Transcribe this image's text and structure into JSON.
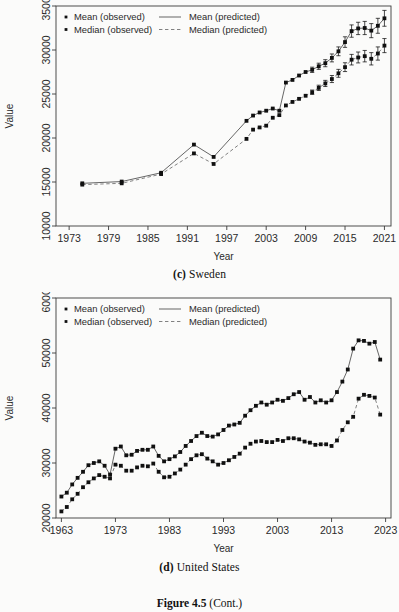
{
  "figure": {
    "caption_number": "Figure 4.5",
    "caption_rest": "(Cont.)"
  },
  "panels": [
    {
      "id": "c",
      "panel_letter": "(c)",
      "panel_title": "Sweden",
      "axis": {
        "xlabel": "Year",
        "ylabel": "Value"
      },
      "legend": {
        "mean_observed": "Mean (observed)",
        "median_observed": "Median (observed)",
        "mean_predicted": "Mean (predicted)",
        "median_predicted": "Median (predicted)"
      }
    },
    {
      "id": "d",
      "panel_letter": "(d)",
      "panel_title": "United States",
      "axis": {
        "xlabel": "Year",
        "ylabel": "Value"
      },
      "legend": {
        "mean_observed": "Mean (observed)",
        "median_observed": "Median (observed)",
        "mean_predicted": "Mean (predicted)",
        "median_predicted": "Median (predicted)"
      }
    }
  ],
  "chart_data": [
    {
      "type": "line",
      "id": "sweden",
      "title": "(c) Sweden",
      "xlabel": "Year",
      "ylabel": "Value",
      "xlim": [
        1971,
        2022
      ],
      "ylim": [
        10000,
        35000
      ],
      "xticks": [
        1973,
        1979,
        1985,
        1991,
        1997,
        2003,
        2009,
        2015,
        2021
      ],
      "yticks": [
        10000,
        15000,
        20000,
        25000,
        30000,
        35000
      ],
      "grid": false,
      "legend_position": "top-left",
      "series": [
        {
          "name": "Mean (observed)",
          "style": "points-solid-line",
          "x": [
            1975,
            1981,
            1987,
            1992,
            1995,
            2000,
            2001,
            2002,
            2003,
            2004,
            2005,
            2006,
            2007,
            2008,
            2009,
            2010,
            2011,
            2012,
            2013,
            2014,
            2015,
            2016,
            2017,
            2018,
            2019,
            2020,
            2021
          ],
          "values": [
            14850,
            15050,
            16050,
            19250,
            17850,
            21950,
            22550,
            22900,
            23100,
            23350,
            23100,
            26300,
            26600,
            27100,
            27500,
            27750,
            28150,
            28500,
            29100,
            29850,
            30900,
            32150,
            32450,
            32500,
            32200,
            32750,
            33600
          ],
          "errors": [
            0,
            0,
            0,
            0,
            0,
            0,
            0,
            0,
            0,
            0,
            0,
            0,
            0,
            0,
            0,
            300,
            350,
            400,
            450,
            500,
            600,
            700,
            700,
            750,
            800,
            850,
            900
          ]
        },
        {
          "name": "Median (observed)",
          "style": "points-dashed-line",
          "x": [
            1975,
            1981,
            1987,
            1992,
            1995,
            2000,
            2001,
            2002,
            2003,
            2004,
            2005,
            2006,
            2007,
            2008,
            2009,
            2010,
            2011,
            2012,
            2013,
            2014,
            2015,
            2016,
            2017,
            2018,
            2019,
            2020,
            2021
          ],
          "values": [
            14700,
            14850,
            15900,
            18250,
            17050,
            19900,
            20950,
            21200,
            21400,
            22300,
            22600,
            23700,
            24100,
            24450,
            24800,
            25200,
            25700,
            26200,
            26700,
            27350,
            28050,
            28900,
            29150,
            29300,
            29000,
            29600,
            30500
          ],
          "errors": [
            0,
            0,
            0,
            0,
            0,
            0,
            0,
            0,
            0,
            0,
            0,
            0,
            0,
            0,
            0,
            250,
            300,
            350,
            400,
            450,
            500,
            600,
            620,
            650,
            700,
            750,
            800
          ]
        }
      ]
    },
    {
      "type": "line",
      "id": "united-states",
      "title": "(d) United States",
      "xlabel": "Year",
      "ylabel": "Value",
      "xlim": [
        1962,
        2024
      ],
      "ylim": [
        20000,
        60000
      ],
      "xticks": [
        1963,
        1973,
        1983,
        1993,
        2003,
        2013,
        2023
      ],
      "yticks": [
        20000,
        30000,
        40000,
        50000,
        60000
      ],
      "grid": false,
      "legend_position": "top-left",
      "series": [
        {
          "name": "Mean (observed)",
          "style": "points-solid-line",
          "x": [
            1963,
            1964,
            1965,
            1966,
            1967,
            1968,
            1969,
            1970,
            1971,
            1972,
            1973,
            1974,
            1975,
            1976,
            1977,
            1978,
            1979,
            1980,
            1981,
            1982,
            1983,
            1984,
            1985,
            1986,
            1987,
            1988,
            1989,
            1990,
            1991,
            1992,
            1993,
            1994,
            1995,
            1996,
            1997,
            1998,
            1999,
            2000,
            2001,
            2002,
            2003,
            2004,
            2005,
            2006,
            2007,
            2008,
            2009,
            2010,
            2011,
            2012,
            2013,
            2014,
            2015,
            2016,
            2017,
            2018,
            2019,
            2020,
            2021,
            2022
          ],
          "values": [
            23900,
            24600,
            26100,
            27300,
            28400,
            29600,
            30000,
            30300,
            29500,
            27900,
            32600,
            33000,
            31400,
            31500,
            32200,
            32400,
            32400,
            33000,
            31300,
            30300,
            30700,
            31200,
            32000,
            33100,
            34000,
            34900,
            35500,
            34900,
            34800,
            35200,
            36000,
            36800,
            37000,
            37300,
            38600,
            39600,
            40400,
            41000,
            40600,
            41000,
            41500,
            41300,
            41800,
            42500,
            42900,
            41500,
            42000,
            41000,
            41400,
            41000,
            41400,
            42900,
            44800,
            47000,
            50800,
            52300,
            52200,
            51700,
            52000,
            48800
          ],
          "errors": [
            0,
            0,
            0,
            0,
            0,
            0,
            0,
            0,
            0,
            0,
            0,
            0,
            0,
            0,
            0,
            0,
            0,
            0,
            0,
            0,
            0,
            0,
            0,
            0,
            0,
            0,
            0,
            0,
            0,
            0,
            0,
            0,
            0,
            0,
            0,
            0,
            0,
            0,
            0,
            0,
            0,
            0,
            0,
            0,
            0,
            0,
            0,
            0,
            0,
            0,
            0,
            0,
            0,
            0,
            0,
            0,
            0,
            0,
            0,
            0
          ]
        },
        {
          "name": "Median (observed)",
          "style": "points-dashed-line",
          "x": [
            1963,
            1964,
            1965,
            1966,
            1967,
            1968,
            1969,
            1970,
            1971,
            1972,
            1973,
            1974,
            1975,
            1976,
            1977,
            1978,
            1979,
            1980,
            1981,
            1982,
            1983,
            1984,
            1985,
            1986,
            1987,
            1988,
            1989,
            1990,
            1991,
            1992,
            1993,
            1994,
            1995,
            1996,
            1997,
            1998,
            1999,
            2000,
            2001,
            2002,
            2003,
            2004,
            2005,
            2006,
            2007,
            2008,
            2009,
            2010,
            2011,
            2012,
            2013,
            2014,
            2015,
            2016,
            2017,
            2018,
            2019,
            2020,
            2021,
            2022
          ],
          "values": [
            21200,
            22000,
            23400,
            24400,
            25600,
            26500,
            27200,
            27800,
            27500,
            27200,
            29700,
            29500,
            28600,
            28600,
            29200,
            29500,
            29400,
            29900,
            28400,
            27400,
            27500,
            28100,
            28800,
            29700,
            30700,
            31400,
            31600,
            30800,
            30300,
            29700,
            30000,
            30500,
            31100,
            31700,
            32800,
            33500,
            33900,
            34000,
            33800,
            33800,
            34200,
            34000,
            34500,
            34500,
            34300,
            33900,
            33700,
            33300,
            33400,
            33400,
            33100,
            34100,
            36000,
            37400,
            38400,
            41700,
            42400,
            42200,
            41900,
            38800
          ],
          "errors": [
            0,
            0,
            0,
            0,
            0,
            0,
            0,
            0,
            0,
            0,
            0,
            0,
            0,
            0,
            0,
            0,
            0,
            0,
            0,
            0,
            0,
            0,
            0,
            0,
            0,
            0,
            0,
            0,
            0,
            0,
            0,
            0,
            0,
            0,
            0,
            0,
            0,
            0,
            0,
            0,
            0,
            0,
            0,
            0,
            0,
            0,
            0,
            0,
            0,
            0,
            0,
            0,
            0,
            0,
            0,
            0,
            0,
            0,
            0,
            0
          ]
        }
      ]
    }
  ]
}
